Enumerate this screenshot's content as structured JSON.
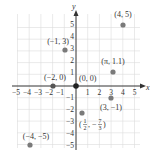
{
  "figure": {
    "type": "cartesian-plane",
    "axes": {
      "x_label": "x",
      "y_label": "y",
      "x_ticks": [
        "−5",
        "−4",
        "−3",
        "−2",
        "−1",
        "1",
        "2",
        "3",
        "4",
        "5"
      ],
      "y_ticks": [
        "5",
        "4",
        "3",
        "2",
        "1",
        "−1",
        "−2",
        "−3",
        "−4",
        "−5"
      ],
      "range": [
        -5,
        5
      ]
    },
    "points": [
      {
        "label": "(4, 5)",
        "x": 4,
        "y": 5
      },
      {
        "label": "(−1, 3)",
        "x": -1,
        "y": 3
      },
      {
        "label": "(π, 1.1)",
        "x": 3.1416,
        "y": 1.1
      },
      {
        "label": "(−2, 0)",
        "x": -2,
        "y": 0
      },
      {
        "label": "(0, 0)",
        "x": 0,
        "y": 0
      },
      {
        "label": "(3, −1)",
        "x": 3,
        "y": -1
      },
      {
        "label_num": "1",
        "label_den": "2",
        "label_num2": "7",
        "label_den2": "3",
        "label": "(1/2, −7/3)",
        "x": 0.5,
        "y": -2.3333
      },
      {
        "label": "(−4, −5)",
        "x": -4,
        "y": -5
      }
    ],
    "colors": {
      "grid": "#d9d9d9",
      "axis": "#333333",
      "point": "#7a7a7a",
      "text": "#333333"
    }
  }
}
